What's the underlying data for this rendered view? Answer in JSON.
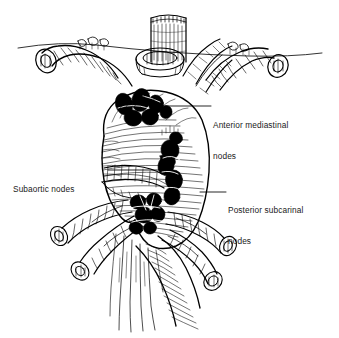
{
  "figure": {
    "kind": "anatomical-line-drawing",
    "ink_color": "#000000",
    "background_color": "#ffffff",
    "width": 339,
    "height": 338
  },
  "labels": {
    "anterior_mediastinal": {
      "line1": "Anterior mediastinal",
      "line2": "nodes"
    },
    "subaortic": {
      "line1": "Subaortic nodes"
    },
    "posterior_subcarinal": {
      "line1": "Posterior subcarinal",
      "line2": "nodes"
    }
  },
  "structures": {
    "trachea": "trachea",
    "aortic_arch": "aortic-arch",
    "left_brachiocephalic_vein": "left-brachiocephalic-vein",
    "great_vessels": "great-vessels",
    "left_main_bronchus": "left-main-bronchus",
    "right_main_bronchus": "right-main-bronchus",
    "descending_aorta": "descending-aorta",
    "esophagus": "esophagus",
    "pleural_reflection_line": "pleural-reflection-line",
    "lymph_nodes": "lymph-node-cluster"
  }
}
